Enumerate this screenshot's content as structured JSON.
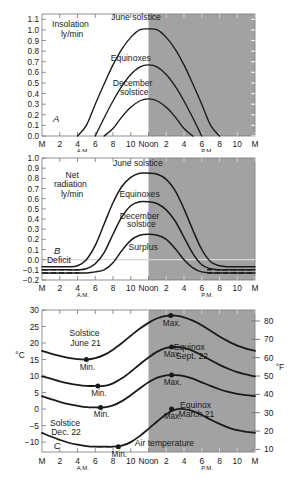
{
  "figure": {
    "shade_color": "#a2a2a2",
    "line_color": "#1a1a1a",
    "axis_color": "#777777",
    "bg_color": "#ffffff",
    "caption": ""
  },
  "xaxis": {
    "ticks": [
      "M",
      "2",
      "4",
      "6",
      "8",
      "10",
      "Noon",
      "2",
      "4",
      "6",
      "8",
      "10",
      "M"
    ],
    "am_label": "A.M.",
    "pm_label": "P.M.",
    "shade_start_tick": "Noon"
  },
  "chart_data": [
    {
      "type": "line",
      "panel": "A",
      "panel_label": "A",
      "title": "Insolation",
      "subtitle": "ly/min",
      "ylabel": "Insolation ly/min",
      "xlabel": "",
      "ylim": [
        0.0,
        1.15
      ],
      "yticks": [
        "0.0",
        "0.1",
        "0.2",
        "0.3",
        "0.4",
        "0.5",
        "0.6",
        "0.7",
        "0.8",
        "0.9",
        "1.0",
        "1.1"
      ],
      "ytick_values": [
        0.0,
        0.1,
        0.2,
        0.3,
        0.4,
        0.5,
        0.6,
        0.7,
        0.8,
        0.9,
        1.0,
        1.1
      ],
      "xlim": [
        0,
        24
      ],
      "x": [
        0,
        1,
        2,
        3,
        4,
        5,
        6,
        7,
        8,
        9,
        10,
        11,
        12,
        13,
        14,
        15,
        16,
        17,
        18,
        19,
        20,
        21,
        22,
        23,
        24
      ],
      "grid": false,
      "legend": "inline-annotations",
      "series": [
        {
          "name": "June solstice",
          "peak": 1.01,
          "sunrise_hour": 4.6,
          "sunset_hour": 19.4,
          "values": [
            0,
            0,
            0,
            0,
            0,
            0.1,
            0.3,
            0.49,
            0.67,
            0.82,
            0.93,
            1.0,
            1.01,
            1.0,
            0.93,
            0.82,
            0.67,
            0.49,
            0.3,
            0.1,
            0,
            0,
            0,
            0,
            0
          ]
        },
        {
          "name": "Equinoxes",
          "peak": 0.67,
          "sunrise_hour": 6.0,
          "sunset_hour": 18.0,
          "values": [
            0,
            0,
            0,
            0,
            0,
            0,
            0,
            0.17,
            0.33,
            0.47,
            0.58,
            0.65,
            0.67,
            0.65,
            0.58,
            0.47,
            0.33,
            0.17,
            0,
            0,
            0,
            0,
            0,
            0,
            0
          ]
        },
        {
          "name": "December solstice",
          "peak": 0.35,
          "sunrise_hour": 7.6,
          "sunset_hour": 16.4,
          "values": [
            0,
            0,
            0,
            0,
            0,
            0,
            0,
            0,
            0.07,
            0.18,
            0.27,
            0.33,
            0.35,
            0.33,
            0.27,
            0.18,
            0.07,
            0,
            0,
            0,
            0,
            0,
            0,
            0,
            0
          ]
        }
      ],
      "annotations": [
        {
          "text": "Insolation",
          "x_hour": 3.2,
          "y_value": 1.03
        },
        {
          "text": "ly/min",
          "x_hour": 3.4,
          "y_value": 0.93
        },
        {
          "text": "June solstice",
          "x_hour": 10.6,
          "y_value": 1.09
        },
        {
          "text": "Equinoxes",
          "x_hour": 10.0,
          "y_value": 0.71
        },
        {
          "text": "December",
          "x_hour": 10.2,
          "y_value": 0.47
        },
        {
          "text": "solstice",
          "x_hour": 10.4,
          "y_value": 0.39
        },
        {
          "text": "A",
          "x_hour": 1.6,
          "y_value": 0.13
        }
      ]
    },
    {
      "type": "line",
      "panel": "B",
      "panel_label": "B",
      "title": "Net radiation",
      "subtitle": "ly/min",
      "ylabel": "Net radiation ly/min",
      "xlabel": "",
      "ylim": [
        -0.2,
        1.0
      ],
      "yticks": [
        "-0.2",
        "-0.1",
        "0.0",
        "0.1",
        "0.2",
        "0.3",
        "0.4",
        "0.5",
        "0.6",
        "0.7",
        "0.8",
        "0.9",
        "1.0"
      ],
      "ytick_values": [
        -0.2,
        -0.1,
        0.0,
        0.1,
        0.2,
        0.3,
        0.4,
        0.5,
        0.6,
        0.7,
        0.8,
        0.9,
        1.0
      ],
      "xlim": [
        0,
        24
      ],
      "grid": false,
      "zero_line": 0.0,
      "series": [
        {
          "name": "June solstice",
          "peak": 0.85,
          "night_value": -0.07,
          "values": [
            -0.07,
            -0.07,
            -0.07,
            -0.07,
            -0.06,
            0.0,
            0.14,
            0.35,
            0.56,
            0.72,
            0.81,
            0.85,
            0.85,
            0.84,
            0.79,
            0.68,
            0.5,
            0.29,
            0.1,
            -0.02,
            -0.06,
            -0.07,
            -0.07,
            -0.07,
            -0.07
          ]
        },
        {
          "name": "Equinoxes",
          "peak": 0.57,
          "night_value": -0.1,
          "values": [
            -0.1,
            -0.1,
            -0.1,
            -0.1,
            -0.1,
            -0.09,
            -0.04,
            0.07,
            0.25,
            0.42,
            0.53,
            0.57,
            0.57,
            0.55,
            0.49,
            0.38,
            0.22,
            0.06,
            -0.05,
            -0.09,
            -0.1,
            -0.1,
            -0.1,
            -0.1,
            -0.1
          ]
        },
        {
          "name": "December solstice",
          "peak": 0.25,
          "night_value": -0.13,
          "values": [
            -0.13,
            -0.13,
            -0.13,
            -0.13,
            -0.13,
            -0.13,
            -0.12,
            -0.1,
            -0.03,
            0.09,
            0.19,
            0.24,
            0.25,
            0.24,
            0.2,
            0.11,
            0.0,
            -0.08,
            -0.12,
            -0.13,
            -0.13,
            -0.13,
            -0.13,
            -0.13,
            -0.13
          ]
        }
      ],
      "annotations": [
        {
          "text": "Net",
          "x_hour": 3.4,
          "y_value": 0.8
        },
        {
          "text": "radiation",
          "x_hour": 3.2,
          "y_value": 0.71
        },
        {
          "text": "ly/min",
          "x_hour": 3.4,
          "y_value": 0.62
        },
        {
          "text": "June solstice",
          "x_hour": 10.8,
          "y_value": 0.92
        },
        {
          "text": "Equinoxes",
          "x_hour": 11.0,
          "y_value": 0.62
        },
        {
          "text": "December",
          "x_hour": 11.0,
          "y_value": 0.4
        },
        {
          "text": "solstice",
          "x_hour": 11.2,
          "y_value": 0.32
        },
        {
          "text": "Surplus",
          "x_hour": 11.4,
          "y_value": 0.1
        },
        {
          "text": "Deficit",
          "x_hour": 1.9,
          "y_value": -0.035
        },
        {
          "text": "B",
          "x_hour": 1.7,
          "y_value": 0.055
        }
      ]
    },
    {
      "type": "line",
      "panel": "C",
      "panel_label": "C",
      "title": "Air temperature",
      "ylabel": "°C",
      "ylabel_right": "°F",
      "xlabel": "",
      "ylim": [
        -13,
        30
      ],
      "yticks": [
        "30",
        "25",
        "20",
        "15",
        "10",
        "5",
        "0",
        "-5",
        "-10"
      ],
      "ytick_values": [
        30,
        25,
        20,
        15,
        10,
        5,
        0,
        -5,
        -10
      ],
      "yticks_right": [
        "80",
        "70",
        "60",
        "50",
        "40",
        "30",
        "20",
        "10"
      ],
      "ytick_values_right": [
        80,
        70,
        60,
        50,
        40,
        30,
        20,
        10
      ],
      "xlim": [
        0,
        24
      ],
      "grid": false,
      "series": [
        {
          "name": "Solstice June 21",
          "min_value": 15.0,
          "min_hour": 5.0,
          "max_value": 28.3,
          "max_hour": 14.5,
          "values": [
            17.6,
            16.8,
            16.1,
            15.5,
            15.1,
            15.0,
            15.4,
            16.4,
            18.0,
            20.0,
            22.2,
            24.3,
            26.1,
            27.5,
            28.2,
            28.3,
            27.8,
            26.8,
            25.4,
            23.7,
            22.0,
            20.5,
            19.2,
            18.3,
            17.6
          ]
        },
        {
          "name": "Equinox Sept. 22",
          "min_value": 7.0,
          "min_hour": 6.3,
          "max_value": 18.8,
          "max_hour": 14.6,
          "values": [
            9.9,
            9.2,
            8.4,
            7.8,
            7.3,
            7.0,
            7.0,
            7.0,
            7.8,
            9.3,
            11.3,
            13.5,
            15.6,
            17.4,
            18.5,
            18.8,
            18.5,
            17.6,
            16.3,
            14.8,
            13.4,
            12.2,
            11.2,
            10.5,
            9.9
          ]
        },
        {
          "name": "Equinox March 21",
          "min_value": 0.5,
          "min_hour": 6.6,
          "max_value": 10.3,
          "max_hour": 14.6,
          "values": [
            3.9,
            3.0,
            2.2,
            1.5,
            1.0,
            0.6,
            0.5,
            0.5,
            1.1,
            2.4,
            4.2,
            6.2,
            8.1,
            9.5,
            10.2,
            10.3,
            10.0,
            9.2,
            8.1,
            7.0,
            6.0,
            5.2,
            4.6,
            4.2,
            3.9
          ]
        },
        {
          "name": "Solstice Dec. 22",
          "min_value": -11.4,
          "min_hour": 8.6,
          "max_value": 0.0,
          "max_hour": 14.6,
          "values": [
            -7.2,
            -8.3,
            -9.3,
            -10.2,
            -10.8,
            -11.2,
            -11.4,
            -11.4,
            -11.4,
            -11.1,
            -10.0,
            -8.2,
            -6.0,
            -3.7,
            -1.6,
            -0.2,
            0.0,
            -0.6,
            -1.8,
            -3.2,
            -4.5,
            -5.6,
            -6.4,
            -6.9,
            -7.2
          ]
        }
      ],
      "markers": [
        {
          "label": "Min.",
          "series": "Solstice June 21",
          "x_hour": 5.0,
          "y_value": 15.0
        },
        {
          "label": "Max.",
          "series": "Solstice June 21",
          "x_hour": 14.5,
          "y_value": 28.3
        },
        {
          "label": "Min.",
          "series": "Equinox Sept. 22",
          "x_hour": 6.3,
          "y_value": 7.0
        },
        {
          "label": "Max.",
          "series": "Equinox Sept. 22",
          "x_hour": 14.6,
          "y_value": 18.8
        },
        {
          "label": "Min.",
          "series": "Equinox March 21",
          "x_hour": 6.6,
          "y_value": 0.5
        },
        {
          "label": "Max.",
          "series": "Equinox March 21",
          "x_hour": 14.6,
          "y_value": 10.3
        },
        {
          "label": "Min.",
          "series": "Solstice Dec. 22",
          "x_hour": 8.6,
          "y_value": -11.4
        },
        {
          "label": "Max.",
          "series": "Solstice Dec. 22",
          "x_hour": 14.6,
          "y_value": 0.0
        }
      ],
      "annotations": [
        {
          "text": "Solstice",
          "x_hour": 4.8,
          "y_value": 22.0
        },
        {
          "text": "June 21",
          "x_hour": 4.9,
          "y_value": 19.2
        },
        {
          "text": "Equinox",
          "x_hour": 16.6,
          "y_value": 18.0
        },
        {
          "text": "Sept. 22",
          "x_hour": 16.9,
          "y_value": 15.3
        },
        {
          "text": "Equinox",
          "x_hour": 17.3,
          "y_value": 0.4
        },
        {
          "text": "March 21",
          "x_hour": 17.4,
          "y_value": -2.3
        },
        {
          "text": "Solstice",
          "x_hour": 2.6,
          "y_value": -5.2
        },
        {
          "text": "Dec. 22",
          "x_hour": 2.7,
          "y_value": -7.8
        },
        {
          "text": "Air temperature",
          "x_hour": 13.8,
          "y_value": -11.3
        },
        {
          "text": "C",
          "x_hour": 1.7,
          "y_value": -12.2
        }
      ]
    }
  ]
}
